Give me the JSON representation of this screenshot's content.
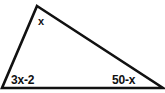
{
  "figure": {
    "type": "triangle-angle-diagram",
    "background_color": "#ffffff",
    "stroke_color": "#111111",
    "stroke_width": 2,
    "width": 165,
    "height": 93
  },
  "labels": {
    "apex_angle": "x",
    "bottom_left_angle": "3x-2",
    "bottom_right_angle": "50-x"
  },
  "geometry": {
    "apex": {
      "x": 37,
      "y": 6
    },
    "bottom_left": {
      "x": 2,
      "y": 88
    },
    "bottom_right": {
      "x": 163,
      "y": 88
    }
  }
}
